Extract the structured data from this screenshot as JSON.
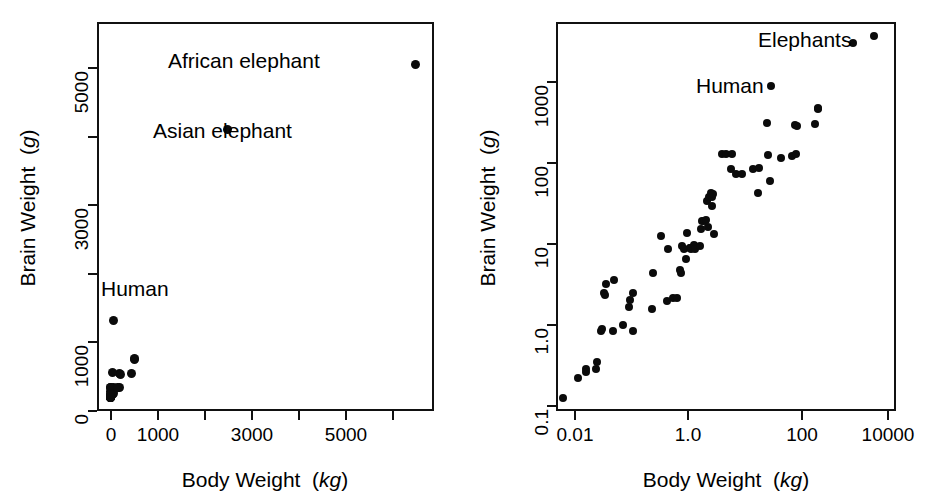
{
  "figure": {
    "background": "#ffffff",
    "point_color": "#0b0b0b",
    "axis_color": "#111111",
    "panels": [
      "linear",
      "log-log"
    ]
  },
  "chart_data": [
    {
      "type": "scatter",
      "panel": "left",
      "scale": {
        "x": "linear",
        "y": "linear"
      },
      "title": "",
      "xlabel": "Body Weight  (kg)",
      "xlabel_text": "Body Weight",
      "xlabel_unit": "kg",
      "ylabel": "Brain Weight (g)",
      "ylabel_text": "Brain Weight",
      "ylabel_unit": "g",
      "xlim": [
        -250,
        7100
      ],
      "ylim": [
        -260,
        6400
      ],
      "xticks": [
        0,
        1000,
        2000,
        3000,
        4000,
        5000,
        6000
      ],
      "xticklabels": [
        "0",
        "1000",
        "",
        "3000",
        "",
        "5000",
        ""
      ],
      "yticks": [
        0,
        1000,
        2000,
        3000,
        4000,
        5000
      ],
      "yticklabels": [
        "0",
        "1000",
        "",
        "3000",
        "",
        "5000"
      ],
      "grid": false,
      "legend": null,
      "annotations": [
        {
          "text": "African elephant",
          "x": 6654,
          "y": 5712,
          "placement": "left-of-point"
        },
        {
          "text": "Asian elephant",
          "x": 2547,
          "y": 4603,
          "placement": "below-point"
        },
        {
          "text": "Human",
          "x": 62,
          "y": 1320,
          "placement": "above-right-of-point"
        }
      ],
      "xy": [
        [
          1.35,
          8.1
        ],
        [
          465,
          423
        ],
        [
          36.33,
          119.5
        ],
        [
          27.66,
          115
        ],
        [
          1.04,
          5.5
        ],
        [
          11700,
          50
        ],
        [
          2547,
          4603
        ],
        [
          187.1,
          419
        ],
        [
          521,
          655
        ],
        [
          10,
          115
        ],
        [
          3.3,
          25.6
        ],
        [
          529,
          680
        ],
        [
          207,
          406
        ],
        [
          62,
          1320
        ],
        [
          6654,
          5712
        ],
        [
          9400,
          70
        ],
        [
          6.8,
          179
        ],
        [
          35,
          56
        ],
        [
          0.12,
          1
        ],
        [
          0.023,
          0.4
        ],
        [
          2.5,
          12.1
        ],
        [
          55.5,
          175
        ],
        [
          100,
          157
        ],
        [
          52.16,
          440
        ],
        [
          10.55,
          179.5
        ],
        [
          0.55,
          2.4
        ],
        [
          60,
          81
        ],
        [
          3.6,
          21
        ],
        [
          4.288,
          39.2
        ],
        [
          0.28,
          1.9
        ],
        [
          0.075,
          1.2
        ],
        [
          0.122,
          3
        ],
        [
          0.048,
          0.33
        ],
        [
          192,
          180
        ],
        [
          3,
          25
        ],
        [
          160,
          169
        ],
        [
          0.9,
          2.6
        ],
        [
          1.62,
          11.4
        ],
        [
          0.104,
          2.5
        ],
        [
          4.235,
          50.4
        ]
      ],
      "note": "62-species mammal brain/body dataset; points rendered at scaled pixel positions"
    },
    {
      "type": "scatter",
      "panel": "right",
      "scale": {
        "x": "log10",
        "y": "log10"
      },
      "title": "",
      "xlabel": "Body Weight  (kg)",
      "xlabel_text": "Body Weight",
      "xlabel_unit": "kg",
      "ylabel": "Brain Weight (g)",
      "ylabel_text": "Brain Weight",
      "ylabel_unit": "g",
      "xlim": [
        0.004,
        20000
      ],
      "ylim": [
        0.09,
        8000
      ],
      "xticks": [
        0.01,
        1.0,
        100,
        10000
      ],
      "xticklabels": [
        "0.01",
        "1.0",
        "100",
        "10000"
      ],
      "yticks": [
        0.1,
        1.0,
        10,
        100,
        1000
      ],
      "yticklabels": [
        "0.1",
        "1.0",
        "10",
        "100",
        "1000"
      ],
      "grid": false,
      "legend": null,
      "annotations": [
        {
          "text": "Elephants",
          "x": 1200,
          "y": 4800,
          "placement": "left-of-points"
        },
        {
          "text": "Human",
          "x": 9,
          "y": 1320,
          "placement": "left-of-point"
        }
      ],
      "xy": [
        [
          0.005,
          0.14
        ],
        [
          0.01,
          0.25
        ],
        [
          0.014,
          0.33
        ],
        [
          0.014,
          0.3
        ],
        [
          0.022,
          0.33
        ],
        [
          0.023,
          0.4
        ],
        [
          0.028,
          1.0
        ],
        [
          0.03,
          1.05
        ],
        [
          0.032,
          3.0
        ],
        [
          0.033,
          2.9
        ],
        [
          0.035,
          4.0
        ],
        [
          0.048,
          1.0
        ],
        [
          0.05,
          4.5
        ],
        [
          0.075,
          1.2
        ],
        [
          0.1,
          2.0
        ],
        [
          0.104,
          2.5
        ],
        [
          0.12,
          1.0
        ],
        [
          0.122,
          3.0
        ],
        [
          0.28,
          1.9
        ],
        [
          0.3,
          5.5
        ],
        [
          0.42,
          16.0
        ],
        [
          0.55,
          2.4
        ],
        [
          0.6,
          11.0
        ],
        [
          0.75,
          2.6
        ],
        [
          0.9,
          2.6
        ],
        [
          1.0,
          6.0
        ],
        [
          1.04,
          5.5
        ],
        [
          1.1,
          12.0
        ],
        [
          1.2,
          11.0
        ],
        [
          1.35,
          8.1
        ],
        [
          1.4,
          17.5
        ],
        [
          1.6,
          11.4
        ],
        [
          1.62,
          11.4
        ],
        [
          1.7,
          11.0
        ],
        [
          1.9,
          12.3
        ],
        [
          2.0,
          11.0
        ],
        [
          2.5,
          12.1
        ],
        [
          2.6,
          20.0
        ],
        [
          2.8,
          25.0
        ],
        [
          3.0,
          25.0
        ],
        [
          3.3,
          25.6
        ],
        [
          3.5,
          44.5
        ],
        [
          3.6,
          21.0
        ],
        [
          3.8,
          50.0
        ],
        [
          4.05,
          56.0
        ],
        [
          4.235,
          50.4
        ],
        [
          4.288,
          39.2
        ],
        [
          4.5,
          55.5
        ],
        [
          4.8,
          17.0
        ],
        [
          6.8,
          179.0
        ],
        [
          8.1,
          179.5
        ],
        [
          10.0,
          115.0
        ],
        [
          10.55,
          179.5
        ],
        [
          13.0,
          98.0
        ],
        [
          17.0,
          100.0
        ],
        [
          27.66,
          115.0
        ],
        [
          35.0,
          56.0
        ],
        [
          36.33,
          119.5
        ],
        [
          52.16,
          440.0
        ],
        [
          55.5,
          175.0
        ],
        [
          60.0,
          81.0
        ],
        [
          62.0,
          1320.0
        ],
        [
          100.0,
          157.0
        ],
        [
          160.0,
          169.0
        ],
        [
          187.1,
          419.0
        ],
        [
          192.0,
          180.0
        ],
        [
          207.0,
          406.0
        ],
        [
          465.0,
          423.0
        ],
        [
          521.0,
          655.0
        ],
        [
          529.0,
          680.0
        ],
        [
          2547.0,
          4603.0
        ],
        [
          6654.0,
          5712.0
        ]
      ],
      "note": "same mammal dataset shown on log-log axes; the two elephants and human are labelled"
    }
  ]
}
